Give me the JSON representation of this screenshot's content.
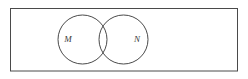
{
  "figure": {
    "type": "venn-diagram",
    "background_color": "#ffffff",
    "stroke_color": "#4a4a4a",
    "label_color": "#3a3a3a",
    "stroke_width": "1"
  },
  "universe": {
    "name": "universal-set-rectangle",
    "label": "",
    "x": 10.5,
    "y": 8.5,
    "width": 227,
    "height": 62.5
  },
  "sets": [
    {
      "id": "set-m",
      "label": "M",
      "cx": 82.5,
      "cy": 39.5,
      "r": 24.5,
      "label_x": 68,
      "label_y": 40
    },
    {
      "id": "set-n",
      "label": "N",
      "cx": 123.5,
      "cy": 39.5,
      "r": 24.5,
      "label_x": 137,
      "label_y": 40
    }
  ],
  "regions": {
    "intersection_label": "",
    "left_only_label": "",
    "right_only_label": "",
    "outside_label": ""
  }
}
